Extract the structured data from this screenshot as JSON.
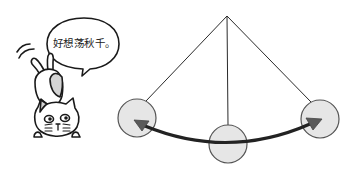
{
  "speech_bubble": {
    "text": "好想荡秋千。"
  },
  "illustration": {
    "subject": "cat-looking-at-pendulum",
    "pendulum": {
      "pivot": [
        227,
        16
      ],
      "bobs": [
        {
          "position": "left",
          "cx": 137,
          "cy": 118,
          "r": 19
        },
        {
          "position": "center",
          "cx": 228,
          "cy": 144,
          "r": 19
        },
        {
          "position": "right",
          "cx": 320,
          "cy": 119,
          "r": 19
        }
      ],
      "arrow": "double-headed-arc"
    },
    "colors": {
      "line": "#222222",
      "bob_fill": "#e6e6e6",
      "bob_stroke": "#555555",
      "arrow": "#333333",
      "arrow_head": "#555555",
      "cat_patch": "#d4d4d4"
    }
  }
}
